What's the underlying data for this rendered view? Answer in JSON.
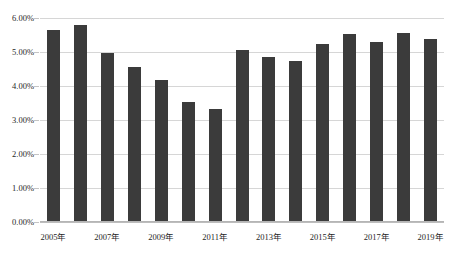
{
  "chart_data": {
    "type": "bar",
    "title": "",
    "xlabel": "",
    "ylabel": "",
    "ylim": [
      0,
      6
    ],
    "ytick_step": 1,
    "grid": true,
    "legend": "none",
    "categories": [
      "2005年",
      "2006年",
      "2007年",
      "2008年",
      "2009年",
      "2010年",
      "2011年",
      "2012年",
      "2013年",
      "2014年",
      "2015年",
      "2016年",
      "2017年",
      "2018年",
      "2019年"
    ],
    "values": [
      5.65,
      5.8,
      4.97,
      4.55,
      4.18,
      3.52,
      3.33,
      5.07,
      4.85,
      4.75,
      5.23,
      5.52,
      5.28,
      5.57,
      5.38
    ],
    "ytick_labels": [
      "6.00%",
      "5.00%",
      "4.00%",
      "3.00%",
      "2.00%",
      "1.00%",
      "0.00%"
    ],
    "ytick_values": [
      6,
      5,
      4,
      3,
      2,
      1,
      0
    ],
    "xtick_labels": [
      "2005年",
      "2007年",
      "2009年",
      "2011年",
      "2013年",
      "2015年",
      "2017年",
      "2019年"
    ],
    "xtick_indices": [
      0,
      2,
      4,
      6,
      8,
      10,
      12,
      14
    ],
    "bar_color": "#3b3b3b",
    "gridline_color": "#d6d6d6",
    "background_color": "#ffffff",
    "value_suffix": "%"
  }
}
